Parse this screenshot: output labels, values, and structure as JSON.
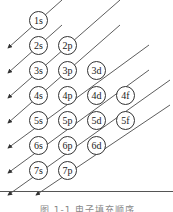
{
  "diagram": {
    "orbitals": [
      {
        "label": "1s",
        "x": 38,
        "y": 20
      },
      {
        "label": "2s",
        "x": 38,
        "y": 45
      },
      {
        "label": "2p",
        "x": 67,
        "y": 45
      },
      {
        "label": "3s",
        "x": 38,
        "y": 70
      },
      {
        "label": "3p",
        "x": 67,
        "y": 70
      },
      {
        "label": "3d",
        "x": 96,
        "y": 70
      },
      {
        "label": "4s",
        "x": 38,
        "y": 95
      },
      {
        "label": "4p",
        "x": 67,
        "y": 95
      },
      {
        "label": "4d",
        "x": 96,
        "y": 95
      },
      {
        "label": "4f",
        "x": 125,
        "y": 95
      },
      {
        "label": "5s",
        "x": 38,
        "y": 120
      },
      {
        "label": "5p",
        "x": 67,
        "y": 120
      },
      {
        "label": "5d",
        "x": 96,
        "y": 120
      },
      {
        "label": "5f",
        "x": 125,
        "y": 120
      },
      {
        "label": "6s",
        "x": 38,
        "y": 145
      },
      {
        "label": "6p",
        "x": 67,
        "y": 145
      },
      {
        "label": "6d",
        "x": 96,
        "y": 145
      },
      {
        "label": "7s",
        "x": 38,
        "y": 170
      },
      {
        "label": "7p",
        "x": 67,
        "y": 170
      }
    ],
    "caption": "图 1-1  电子填充顺序"
  }
}
